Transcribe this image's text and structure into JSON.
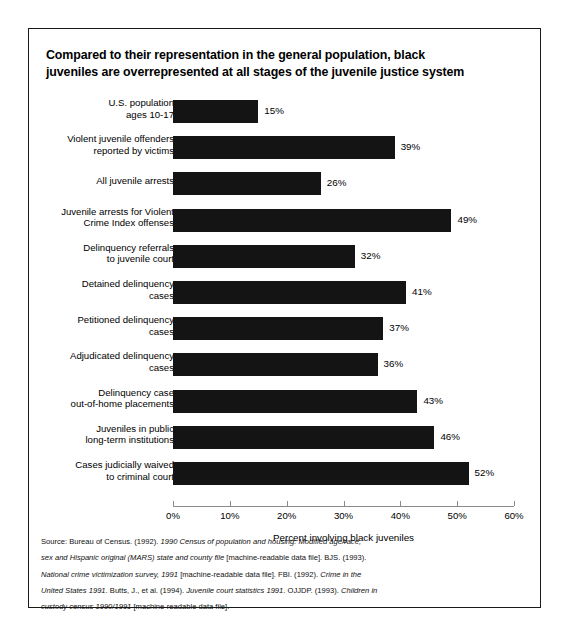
{
  "title": {
    "line1": "Compared to their representation in the general population, black",
    "line2": "juveniles are overrepresented at all stages of the juvenile justice system"
  },
  "axis": {
    "xlabel": "Percent involving black juveniles",
    "ticks": [
      "0%",
      "10%",
      "20%",
      "30%",
      "40%",
      "50%",
      "60%"
    ]
  },
  "rows": [
    {
      "label_line1": "U.S. population",
      "label_line2": "ages 10-17",
      "value": 15,
      "value_label": "15%"
    },
    {
      "label_line1": "Violent juvenile offenders",
      "label_line2": "reported by victims",
      "value": 39,
      "value_label": "39%"
    },
    {
      "label_line1": "All juvenile arrests",
      "label_line2": "",
      "value": 26,
      "value_label": "26%"
    },
    {
      "label_line1": "Juvenile arrests for Violent",
      "label_line2": "Crime Index offenses",
      "value": 49,
      "value_label": "49%"
    },
    {
      "label_line1": "Delinquency referrals",
      "label_line2": "to juvenile court",
      "value": 32,
      "value_label": "32%"
    },
    {
      "label_line1": "Detained delinquency",
      "label_line2": "cases",
      "value": 41,
      "value_label": "41%"
    },
    {
      "label_line1": "Petitioned delinquency",
      "label_line2": "cases",
      "value": 37,
      "value_label": "37%"
    },
    {
      "label_line1": "Adjudicated delinquency",
      "label_line2": "cases",
      "value": 36,
      "value_label": "36%"
    },
    {
      "label_line1": "Delinquency case",
      "label_line2": "out-of-home placements",
      "value": 43,
      "value_label": "43%"
    },
    {
      "label_line1": "Juveniles in public",
      "label_line2": "long-term institutions",
      "value": 46,
      "value_label": "46%"
    },
    {
      "label_line1": "Cases judicially waived",
      "label_line2": "to criminal court",
      "value": 52,
      "value_label": "52%"
    }
  ],
  "source": {
    "line1_a": "Source:  Bureau of Census.  (1992).  ",
    "line1_i": "1990 Census of population and housing:  Modified age/race,",
    "line2_i": "sex and Hispanic original (MARS) state and county file",
    "line2_a": " [machine-readable data file].  BJS.  (1993).",
    "line3_i": "National crime victimization survey, 1991",
    "line3_a": " [machine-readable data file].  FBI.  (1992).  ",
    "line3_i2": "Crime in the",
    "line4_i": "United States 1991",
    "line4_a": ".  Butts, J., et al.  (1994).  ",
    "line4_i2": "Juvenile court statistics 1991",
    "line4_a2": ".  OJJDP.  (1993).  ",
    "line4_i3": "Children in",
    "line5_i": "custody census 1990/1991",
    "line5_a": " [machine-readable data file]."
  },
  "chart_data": {
    "type": "bar",
    "orientation": "horizontal",
    "title": "Compared to their representation in the general population, black juveniles are overrepresented at all stages of the juvenile justice system",
    "xlabel": "Percent involving black juveniles",
    "ylabel": "",
    "xlim": [
      0,
      60
    ],
    "xticks": [
      0,
      10,
      20,
      30,
      40,
      50,
      60
    ],
    "grid": false,
    "legend": "none",
    "bar_color": "#141414",
    "categories": [
      "U.S. population ages 10-17",
      "Violent juvenile offenders reported by victims",
      "All juvenile arrests",
      "Juvenile arrests for Violent Crime Index offenses",
      "Delinquency referrals to juvenile court",
      "Detained delinquency cases",
      "Petitioned delinquency cases",
      "Adjudicated delinquency cases",
      "Delinquency case out-of-home placements",
      "Juveniles in public long-term institutions",
      "Cases judicially waived to criminal court"
    ],
    "values": [
      15,
      39,
      26,
      49,
      32,
      41,
      37,
      36,
      43,
      46,
      52
    ],
    "value_labels": [
      "15%",
      "39%",
      "26%",
      "49%",
      "32%",
      "41%",
      "37%",
      "36%",
      "43%",
      "46%",
      "52%"
    ],
    "units": "percent"
  }
}
